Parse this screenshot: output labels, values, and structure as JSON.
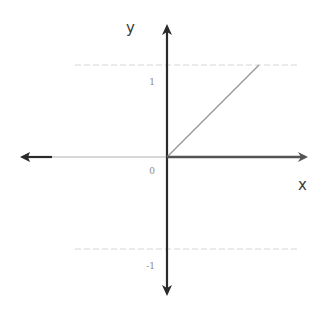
{
  "chart_data": {
    "type": "line",
    "title": "",
    "xlabel": "x",
    "ylabel": "y",
    "xlim": [
      -1.6,
      1.5
    ],
    "ylim": [
      -1.45,
      1.45
    ],
    "grid": "horizontal dotted at y = 1 and y = -1",
    "y_ticks": [
      {
        "value": 1,
        "label": "1"
      },
      {
        "value": 0,
        "label": "0"
      },
      {
        "value": -1,
        "label": "-1"
      }
    ],
    "series": [
      {
        "name": "diagonal",
        "points": [
          [
            0,
            0
          ],
          [
            1,
            1
          ]
        ],
        "color": "#9a9a9a",
        "style": "thin"
      },
      {
        "name": "positive-x-axis-highlight",
        "points": [
          [
            0,
            0
          ],
          [
            1.5,
            0
          ]
        ],
        "color": "#555555",
        "style": "bold"
      }
    ],
    "axes_color": "#2a2a2a",
    "grid_color": "#d6d6d6"
  }
}
